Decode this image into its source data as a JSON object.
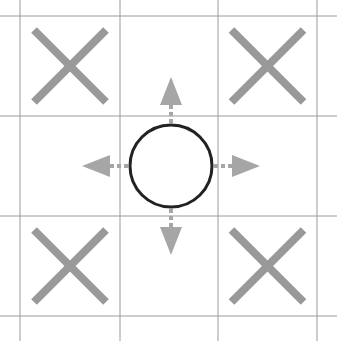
{
  "diagram": {
    "grid": {
      "rows": 3,
      "cols": 3
    },
    "cells": [
      {
        "row": 0,
        "col": 0,
        "mark": "X"
      },
      {
        "row": 0,
        "col": 1,
        "mark": ""
      },
      {
        "row": 0,
        "col": 2,
        "mark": "X"
      },
      {
        "row": 1,
        "col": 0,
        "mark": ""
      },
      {
        "row": 1,
        "col": 1,
        "mark": "O"
      },
      {
        "row": 1,
        "col": 2,
        "mark": ""
      },
      {
        "row": 2,
        "col": 0,
        "mark": "X"
      },
      {
        "row": 2,
        "col": 1,
        "mark": ""
      },
      {
        "row": 2,
        "col": 2,
        "mark": "X"
      }
    ],
    "arrows": [
      "up",
      "down",
      "left",
      "right"
    ],
    "colors": {
      "background": "#ffffff",
      "grid_line": "#9a9a9a",
      "x_mark": "#999999",
      "o_mark": "#222222",
      "arrow": "#a6a6a6"
    }
  }
}
